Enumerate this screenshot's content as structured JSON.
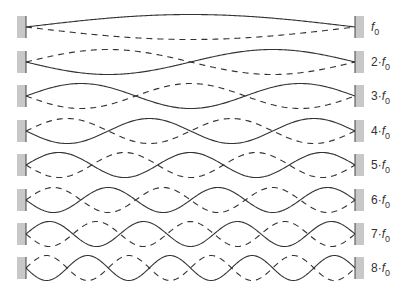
{
  "diagram": {
    "title": "",
    "type": "standing-wave harmonics on a string fixed at both ends",
    "colors": {
      "background": "#ffffff",
      "wall": "#c8c8c8",
      "wall_edge": "#444444",
      "solid_wave": "#333333",
      "dashed_wave": "#333333",
      "label": "#333333"
    },
    "geometry": {
      "wall_left_x": 17,
      "wall_right_x": 355,
      "wall_width": 9,
      "wall_height": 22,
      "string_x0": 26,
      "string_x1": 355,
      "amplitude": 12.5,
      "label_x": 371
    },
    "harmonics": [
      {
        "n": 1,
        "center_y": 27,
        "label_prefix": "",
        "label_base": "f",
        "label_sub": "0",
        "solid_sign": 1
      },
      {
        "n": 2,
        "center_y": 62,
        "label_prefix": "2·",
        "label_base": "f",
        "label_sub": "0",
        "solid_sign": -1
      },
      {
        "n": 3,
        "center_y": 96,
        "label_prefix": "3·",
        "label_base": "f",
        "label_sub": "0",
        "solid_sign": 1
      },
      {
        "n": 4,
        "center_y": 131,
        "label_prefix": "4·",
        "label_base": "f",
        "label_sub": "0",
        "solid_sign": -1
      },
      {
        "n": 5,
        "center_y": 165,
        "label_prefix": "5·",
        "label_base": "f",
        "label_sub": "0",
        "solid_sign": 1
      },
      {
        "n": 6,
        "center_y": 200,
        "label_prefix": "6·",
        "label_base": "f",
        "label_sub": "0",
        "solid_sign": -1
      },
      {
        "n": 7,
        "center_y": 234,
        "label_prefix": "7·",
        "label_base": "f",
        "label_sub": "0",
        "solid_sign": 1
      },
      {
        "n": 8,
        "center_y": 268,
        "label_prefix": "8·",
        "label_base": "f",
        "label_sub": "0",
        "solid_sign": -1
      }
    ]
  }
}
